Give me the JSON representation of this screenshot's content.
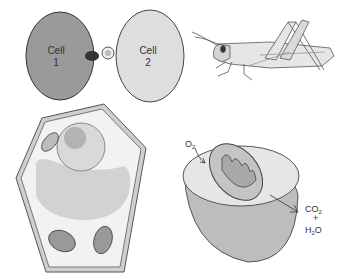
{
  "panels": {
    "cell_interaction": {
      "cell1_label_line1": "Cell",
      "cell1_label_line2": "1",
      "cell2_label_line1": "Cell",
      "cell2_label_line2": "2",
      "colors": {
        "cell1": "#9a9a9a",
        "cell2": "#dcdcdc"
      }
    },
    "grasshopper": {
      "name": "grasshopper"
    },
    "plant_cell": {
      "name": "plant cell"
    },
    "mitochondrion": {
      "input_label": "O",
      "input_sub": "2",
      "output_line1": "CO",
      "output_line1_sub": "2",
      "output_plus": "+",
      "output_line3_a": "H",
      "output_line3_sub": "2",
      "output_line3_b": "O"
    }
  }
}
